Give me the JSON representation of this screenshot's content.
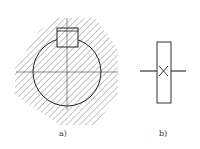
{
  "figures": [
    {
      "id": "a",
      "label": "a)",
      "description": "Cross-section of shaft with key in hub, hatched",
      "hatch_color": "#888888",
      "outline_color": "#222222"
    },
    {
      "id": "b",
      "label": "b)",
      "description": "Schematic symbol of keyed joint: rectangle with X and lead lines",
      "outline_color": "#333333"
    }
  ]
}
